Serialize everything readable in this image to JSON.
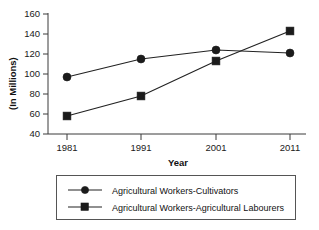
{
  "chart_data": {
    "type": "line",
    "title": "",
    "xlabel": "Year",
    "ylabel": "(In Millions)",
    "categories": [
      "1981",
      "1991",
      "2001",
      "2011"
    ],
    "x": [
      1981,
      1991,
      2001,
      2011
    ],
    "xlim": [
      1981,
      2011
    ],
    "ylim": [
      40,
      160
    ],
    "yticks": [
      "40",
      "60",
      "80",
      "100",
      "120",
      "140",
      "160"
    ],
    "ytick_values": [
      40,
      60,
      80,
      100,
      120,
      140,
      160
    ],
    "grid": false,
    "legend_position": "below",
    "series": [
      {
        "name": "Agricultural Workers-Cultivators",
        "marker": "circle",
        "color": "#1b1b1b",
        "values": [
          97,
          115,
          124,
          121
        ]
      },
      {
        "name": "Agricultural Workers-Agricultural Labourers",
        "marker": "square",
        "color": "#1b1b1b",
        "values": [
          58,
          78,
          113,
          143
        ]
      }
    ]
  },
  "axes": {
    "y_title": "(In Millions)",
    "x_title": "Year"
  },
  "legend": {
    "entries": [
      {
        "label": "Agricultural Workers-Cultivators",
        "marker": "circle-marker-icon"
      },
      {
        "label": "Agricultural Workers-Agricultural Labourers",
        "marker": "square-marker-icon"
      }
    ]
  }
}
